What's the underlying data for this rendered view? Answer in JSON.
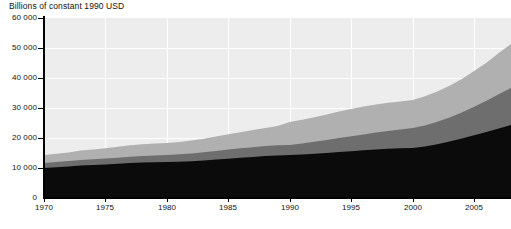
{
  "chart_data": {
    "type": "area",
    "title": "Billions of constant 1990 USD",
    "xlabel": "",
    "ylabel": "",
    "stacked": true,
    "grid": true,
    "legend": "none",
    "xlim": [
      1970,
      2008
    ],
    "ylim": [
      0,
      60000
    ],
    "ytick_values": [
      0,
      10000,
      20000,
      30000,
      40000,
      50000,
      60000
    ],
    "ytick_labels": [
      "0",
      "10 000",
      "20 000",
      "30 000",
      "40 000",
      "50 000",
      "60 000"
    ],
    "xtick_values": [
      1970,
      1975,
      1980,
      1985,
      1990,
      1995,
      2000,
      2005
    ],
    "xtick_labels": [
      "1970",
      "1975",
      "1980",
      "1985",
      "1990",
      "1995",
      "2000",
      "2005"
    ],
    "x": [
      1970,
      1971,
      1972,
      1973,
      1974,
      1975,
      1976,
      1977,
      1978,
      1979,
      1980,
      1981,
      1982,
      1983,
      1984,
      1985,
      1986,
      1987,
      1988,
      1989,
      1990,
      1991,
      1992,
      1993,
      1994,
      1995,
      1996,
      1997,
      1998,
      1999,
      2000,
      2001,
      2002,
      2003,
      2004,
      2005,
      2006,
      2007,
      2008
    ],
    "series": [
      {
        "name": "series-bottom",
        "color": "#0b0b0b",
        "values": [
          10000,
          10250,
          10500,
          10800,
          11000,
          11150,
          11400,
          11650,
          11850,
          11950,
          12000,
          12100,
          12250,
          12500,
          12800,
          13100,
          13400,
          13700,
          14000,
          14150,
          14300,
          14500,
          14750,
          15000,
          15300,
          15600,
          15900,
          16200,
          16450,
          16600,
          16700,
          17200,
          17900,
          18800,
          19800,
          20900,
          22000,
          23200,
          24300
        ]
      },
      {
        "name": "series-middle",
        "color": "#6e6e6e",
        "values": [
          1700,
          1750,
          1800,
          1900,
          1950,
          2000,
          2050,
          2100,
          2150,
          2200,
          2300,
          2450,
          2600,
          2750,
          2900,
          3050,
          3150,
          3250,
          3350,
          3450,
          3400,
          3700,
          4000,
          4300,
          4700,
          5000,
          5300,
          5600,
          5900,
          6200,
          6600,
          7000,
          7500,
          8000,
          8700,
          9500,
          10400,
          11400,
          12400
        ]
      },
      {
        "name": "series-top",
        "color": "#b0b0b0",
        "values": [
          2600,
          2750,
          2900,
          3100,
          3250,
          3400,
          3600,
          3800,
          3950,
          4050,
          4000,
          4100,
          4300,
          4500,
          4800,
          5100,
          5400,
          5700,
          6000,
          6400,
          7600,
          7900,
          8200,
          8500,
          8800,
          9100,
          9300,
          9400,
          9400,
          9400,
          9400,
          9700,
          10100,
          10600,
          11200,
          11900,
          12700,
          13700,
          14600
        ]
      }
    ]
  },
  "axis": {
    "plot_background": "#ededed",
    "gridline_color": "#ffffff",
    "axis_color": "#000000"
  }
}
